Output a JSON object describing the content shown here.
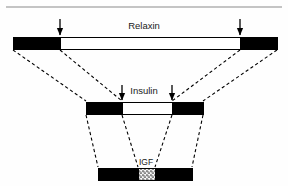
{
  "figure": {
    "type": "protein-domain-homology-diagram",
    "background_color": "#fefefe",
    "ink_color": "#000000",
    "rule_color": "#8a8a8a",
    "top_rule": {
      "name": "top-horizontal-rule",
      "x1": 6,
      "x2": 282,
      "y": 7,
      "thickness": 1.2
    },
    "bars": [
      {
        "id": "relaxin",
        "label": "Relaxin",
        "label_x": 144,
        "label_y": 29,
        "label_size": "bar-label",
        "x": 13,
        "y": 37,
        "width": 264,
        "height": 12,
        "segments": [
          {
            "id": "relaxin-b-chain",
            "fill": "solid-black",
            "x": 13,
            "width": 47
          },
          {
            "id": "relaxin-c-peptide",
            "fill": "white",
            "x": 60,
            "width": 180
          },
          {
            "id": "relaxin-a-chain",
            "fill": "solid-black",
            "x": 240,
            "width": 37
          }
        ],
        "arrows": [
          {
            "id": "relaxin-left-cleavage-arrow",
            "x": 60,
            "y_top": 19,
            "y_tip": 35
          },
          {
            "id": "relaxin-right-cleavage-arrow",
            "x": 240,
            "y_top": 19,
            "y_tip": 35
          }
        ]
      },
      {
        "id": "insulin",
        "label": "Insulin",
        "label_x": 144,
        "label_y": 94,
        "label_size": "bar-label",
        "x": 86,
        "y": 102,
        "width": 117,
        "height": 12,
        "segments": [
          {
            "id": "insulin-b-chain",
            "fill": "solid-black",
            "x": 86,
            "width": 36
          },
          {
            "id": "insulin-c-peptide",
            "fill": "white",
            "x": 122,
            "width": 50
          },
          {
            "id": "insulin-a-chain",
            "fill": "solid-black",
            "x": 172,
            "width": 31
          }
        ],
        "arrows": [
          {
            "id": "insulin-left-cleavage-arrow",
            "x": 122,
            "y_top": 85,
            "y_tip": 100
          },
          {
            "id": "insulin-right-cleavage-arrow",
            "x": 172,
            "y_top": 85,
            "y_tip": 100
          }
        ]
      },
      {
        "id": "igf",
        "label": "IGF",
        "label_x": 146,
        "label_y": 165,
        "label_size": "bar-label-small",
        "x": 98,
        "y": 168,
        "width": 94,
        "height": 12,
        "segments": [
          {
            "id": "igf-b-domain",
            "fill": "solid-black",
            "x": 98,
            "width": 40
          },
          {
            "id": "igf-c-domain",
            "fill": "stipple",
            "x": 138,
            "width": 17
          },
          {
            "id": "igf-a-domain",
            "fill": "solid-black",
            "x": 155,
            "width": 37
          }
        ],
        "arrows": []
      }
    ],
    "connectors": {
      "name": "homology-dashed-connectors",
      "dash_pattern": "3.2 2.6",
      "stroke_width": 1.1,
      "lines": [
        {
          "id": "relaxin-left-outer-to-insulin-left-outer",
          "x1": 13,
          "y1": 50,
          "x2": 86,
          "y2": 101
        },
        {
          "id": "relaxin-left-inner-to-insulin-left-inner",
          "x1": 60,
          "y1": 50,
          "x2": 122,
          "y2": 101
        },
        {
          "id": "relaxin-right-inner-to-insulin-right-inner",
          "x1": 240,
          "y1": 50,
          "x2": 172,
          "y2": 101
        },
        {
          "id": "relaxin-right-outer-to-insulin-right-outer",
          "x1": 277,
          "y1": 50,
          "x2": 203,
          "y2": 101
        },
        {
          "id": "insulin-left-outer-to-igf-left-outer",
          "x1": 86,
          "y1": 115,
          "x2": 98,
          "y2": 167
        },
        {
          "id": "insulin-left-inner-to-igf-left-inner",
          "x1": 122,
          "y1": 115,
          "x2": 138,
          "y2": 167
        },
        {
          "id": "insulin-right-inner-to-igf-right-inner",
          "x1": 172,
          "y1": 115,
          "x2": 155,
          "y2": 167
        },
        {
          "id": "insulin-right-outer-to-igf-right-outer",
          "x1": 203,
          "y1": 115,
          "x2": 192,
          "y2": 167
        }
      ]
    }
  }
}
